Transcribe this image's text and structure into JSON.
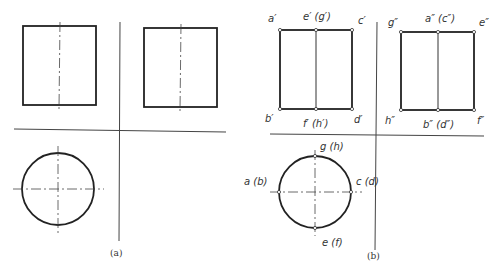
{
  "figure_a": {
    "caption": "(a)",
    "views": [
      "front-view-rectangle",
      "side-view-rectangle",
      "top-view-circle"
    ]
  },
  "figure_b": {
    "caption": "(b)",
    "front_view_labels": {
      "top_left": "a′",
      "top_mid": "e′ (g′)",
      "top_right": "c′",
      "bottom_left": "b′",
      "bottom_mid": "f′ (h′)",
      "bottom_right": "d′"
    },
    "side_view_labels": {
      "top_left": "g″",
      "top_mid": "a″ (c″)",
      "top_right": "e″",
      "bottom_left": "h″",
      "bottom_mid": "b″ (d″)",
      "bottom_right": "f″"
    },
    "top_view_labels": {
      "top": "g (h)",
      "left": "a (b)",
      "right": "c (d)",
      "bottom": "e (f)"
    }
  }
}
